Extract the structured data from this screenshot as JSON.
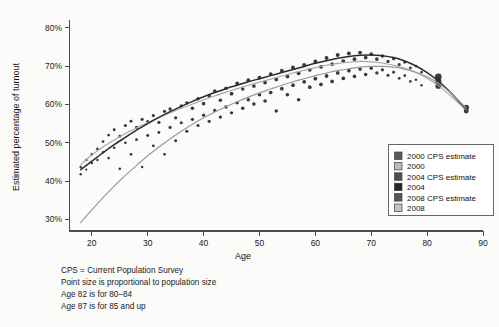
{
  "chart_data": {
    "type": "scatter",
    "title": "",
    "xlabel": "Age",
    "ylabel": "Estimated percentage of turnout",
    "xlim": [
      16,
      90
    ],
    "ylim": [
      0.27,
      0.82
    ],
    "xticks": [
      20,
      30,
      40,
      50,
      60,
      70,
      80,
      90
    ],
    "xtick_labels": [
      "20",
      "30",
      "40",
      "50",
      "60",
      "70",
      "80",
      "90"
    ],
    "yticks": [
      0.3,
      0.4,
      0.5,
      0.6,
      0.7,
      0.8
    ],
    "ytick_labels": [
      "30%",
      "40%",
      "50%",
      "60%",
      "70%",
      "80%"
    ],
    "grid": false,
    "legend_position": "right-lower",
    "note": "Point size is proportional to population size; ages 82 and 87 are aggregated bins.",
    "series": [
      {
        "name": "2000 CPS estimate",
        "color": "#555555",
        "marker": "square",
        "role": "legend-only-swatch"
      },
      {
        "name": "2000",
        "color": "#a8a8a8",
        "marker": "square",
        "role": "fitted-curve",
        "x": [
          18,
          20,
          22,
          24,
          26,
          28,
          30,
          32,
          34,
          36,
          38,
          40,
          42,
          44,
          46,
          48,
          50,
          52,
          54,
          56,
          58,
          60,
          62,
          64,
          66,
          68,
          70,
          72,
          74,
          76,
          78,
          80,
          82,
          84,
          86,
          87
        ],
        "y": [
          0.443,
          0.468,
          0.489,
          0.507,
          0.524,
          0.539,
          0.553,
          0.566,
          0.578,
          0.59,
          0.601,
          0.612,
          0.622,
          0.632,
          0.641,
          0.65,
          0.658,
          0.666,
          0.674,
          0.682,
          0.689,
          0.696,
          0.702,
          0.707,
          0.71,
          0.712,
          0.711,
          0.708,
          0.702,
          0.694,
          0.683,
          0.668,
          0.649,
          0.625,
          0.598,
          0.585
        ]
      },
      {
        "name": "2004 CPS estimate",
        "color": "#4a4a4a",
        "marker": "square",
        "role": "legend-only-swatch"
      },
      {
        "name": "2004",
        "color": "#2b2b2b",
        "marker": "square",
        "role": "fitted-curve",
        "x": [
          18,
          20,
          22,
          24,
          26,
          28,
          30,
          32,
          34,
          36,
          38,
          40,
          42,
          44,
          46,
          48,
          50,
          52,
          54,
          56,
          58,
          60,
          62,
          64,
          66,
          68,
          70,
          72,
          74,
          76,
          78,
          80,
          82,
          84,
          86,
          87
        ],
        "y": [
          0.43,
          0.452,
          0.474,
          0.495,
          0.514,
          0.533,
          0.55,
          0.566,
          0.581,
          0.595,
          0.608,
          0.62,
          0.631,
          0.641,
          0.65,
          0.659,
          0.667,
          0.675,
          0.683,
          0.691,
          0.699,
          0.707,
          0.714,
          0.72,
          0.725,
          0.728,
          0.729,
          0.727,
          0.722,
          0.713,
          0.7,
          0.683,
          0.661,
          0.634,
          0.603,
          0.588
        ]
      },
      {
        "name": "2008 CPS estimate",
        "color": "#555555",
        "marker": "square",
        "role": "legend-only-swatch"
      },
      {
        "name": "2008",
        "color": "#9a9a9a",
        "marker": "square",
        "role": "fitted-curve",
        "x": [
          18,
          20,
          22,
          24,
          26,
          28,
          30,
          32,
          34,
          36,
          38,
          40,
          42,
          44,
          46,
          48,
          50,
          52,
          54,
          56,
          58,
          60,
          62,
          64,
          66,
          68,
          70,
          72,
          74,
          76,
          78,
          80,
          82,
          84,
          86,
          87
        ],
        "y": [
          0.292,
          0.325,
          0.357,
          0.387,
          0.415,
          0.441,
          0.466,
          0.489,
          0.51,
          0.53,
          0.548,
          0.565,
          0.58,
          0.594,
          0.607,
          0.619,
          0.63,
          0.64,
          0.65,
          0.659,
          0.667,
          0.675,
          0.682,
          0.688,
          0.693,
          0.697,
          0.699,
          0.699,
          0.697,
          0.692,
          0.684,
          0.672,
          0.655,
          0.633,
          0.605,
          0.59
        ]
      }
    ],
    "points": [
      {
        "x": 18,
        "y": 0.437,
        "s": 2.0
      },
      {
        "x": 18,
        "y": 0.418,
        "s": 1.9
      },
      {
        "x": 19,
        "y": 0.455,
        "s": 2.0
      },
      {
        "x": 19,
        "y": 0.43,
        "s": 1.8
      },
      {
        "x": 20,
        "y": 0.47,
        "s": 2.2
      },
      {
        "x": 20,
        "y": 0.447,
        "s": 2.0
      },
      {
        "x": 21,
        "y": 0.484,
        "s": 2.1
      },
      {
        "x": 21,
        "y": 0.455,
        "s": 1.9
      },
      {
        "x": 22,
        "y": 0.503,
        "s": 2.2
      },
      {
        "x": 22,
        "y": 0.475,
        "s": 2.0
      },
      {
        "x": 23,
        "y": 0.52,
        "s": 2.3
      },
      {
        "x": 23,
        "y": 0.46,
        "s": 2.1
      },
      {
        "x": 24,
        "y": 0.534,
        "s": 2.4
      },
      {
        "x": 24,
        "y": 0.487,
        "s": 2.2
      },
      {
        "x": 25,
        "y": 0.517,
        "s": 2.3
      },
      {
        "x": 25,
        "y": 0.432,
        "s": 2.1
      },
      {
        "x": 26,
        "y": 0.545,
        "s": 2.5
      },
      {
        "x": 26,
        "y": 0.5,
        "s": 2.2
      },
      {
        "x": 27,
        "y": 0.556,
        "s": 2.4
      },
      {
        "x": 27,
        "y": 0.47,
        "s": 2.2
      },
      {
        "x": 28,
        "y": 0.54,
        "s": 2.5
      },
      {
        "x": 28,
        "y": 0.508,
        "s": 2.3
      },
      {
        "x": 29,
        "y": 0.561,
        "s": 2.5
      },
      {
        "x": 29,
        "y": 0.437,
        "s": 2.0
      },
      {
        "x": 30,
        "y": 0.555,
        "s": 2.6
      },
      {
        "x": 30,
        "y": 0.519,
        "s": 2.4
      },
      {
        "x": 31,
        "y": 0.571,
        "s": 2.5
      },
      {
        "x": 31,
        "y": 0.492,
        "s": 2.3
      },
      {
        "x": 32,
        "y": 0.553,
        "s": 2.6
      },
      {
        "x": 32,
        "y": 0.527,
        "s": 2.4
      },
      {
        "x": 33,
        "y": 0.582,
        "s": 2.6
      },
      {
        "x": 33,
        "y": 0.47,
        "s": 2.2
      },
      {
        "x": 34,
        "y": 0.588,
        "s": 2.7
      },
      {
        "x": 34,
        "y": 0.54,
        "s": 2.5
      },
      {
        "x": 35,
        "y": 0.565,
        "s": 2.6
      },
      {
        "x": 35,
        "y": 0.505,
        "s": 2.4
      },
      {
        "x": 36,
        "y": 0.596,
        "s": 2.7
      },
      {
        "x": 36,
        "y": 0.552,
        "s": 2.5
      },
      {
        "x": 37,
        "y": 0.604,
        "s": 2.7
      },
      {
        "x": 37,
        "y": 0.53,
        "s": 2.5
      },
      {
        "x": 38,
        "y": 0.59,
        "s": 2.8
      },
      {
        "x": 38,
        "y": 0.561,
        "s": 2.6
      },
      {
        "x": 39,
        "y": 0.615,
        "s": 2.8
      },
      {
        "x": 39,
        "y": 0.545,
        "s": 2.6
      },
      {
        "x": 40,
        "y": 0.602,
        "s": 2.9
      },
      {
        "x": 40,
        "y": 0.572,
        "s": 2.7
      },
      {
        "x": 41,
        "y": 0.622,
        "s": 2.8
      },
      {
        "x": 41,
        "y": 0.556,
        "s": 2.6
      },
      {
        "x": 42,
        "y": 0.635,
        "s": 2.9
      },
      {
        "x": 42,
        "y": 0.584,
        "s": 2.7
      },
      {
        "x": 43,
        "y": 0.611,
        "s": 2.8
      },
      {
        "x": 43,
        "y": 0.567,
        "s": 2.7
      },
      {
        "x": 44,
        "y": 0.642,
        "s": 2.9
      },
      {
        "x": 44,
        "y": 0.593,
        "s": 2.8
      },
      {
        "x": 45,
        "y": 0.628,
        "s": 3.0
      },
      {
        "x": 45,
        "y": 0.578,
        "s": 2.7
      },
      {
        "x": 46,
        "y": 0.655,
        "s": 3.0
      },
      {
        "x": 46,
        "y": 0.604,
        "s": 2.8
      },
      {
        "x": 47,
        "y": 0.64,
        "s": 2.9
      },
      {
        "x": 47,
        "y": 0.59,
        "s": 2.8
      },
      {
        "x": 48,
        "y": 0.663,
        "s": 3.0
      },
      {
        "x": 48,
        "y": 0.612,
        "s": 2.9
      },
      {
        "x": 49,
        "y": 0.648,
        "s": 3.0
      },
      {
        "x": 49,
        "y": 0.601,
        "s": 2.8
      },
      {
        "x": 50,
        "y": 0.67,
        "s": 3.1
      },
      {
        "x": 50,
        "y": 0.625,
        "s": 2.9
      },
      {
        "x": 51,
        "y": 0.657,
        "s": 3.0
      },
      {
        "x": 51,
        "y": 0.609,
        "s": 2.9
      },
      {
        "x": 52,
        "y": 0.679,
        "s": 3.1
      },
      {
        "x": 52,
        "y": 0.631,
        "s": 3.0
      },
      {
        "x": 53,
        "y": 0.665,
        "s": 3.0
      },
      {
        "x": 53,
        "y": 0.583,
        "s": 2.8
      },
      {
        "x": 54,
        "y": 0.688,
        "s": 3.1
      },
      {
        "x": 54,
        "y": 0.641,
        "s": 3.0
      },
      {
        "x": 55,
        "y": 0.673,
        "s": 3.1
      },
      {
        "x": 55,
        "y": 0.625,
        "s": 2.9
      },
      {
        "x": 56,
        "y": 0.696,
        "s": 3.2
      },
      {
        "x": 56,
        "y": 0.65,
        "s": 3.0
      },
      {
        "x": 57,
        "y": 0.681,
        "s": 3.1
      },
      {
        "x": 57,
        "y": 0.612,
        "s": 2.9
      },
      {
        "x": 58,
        "y": 0.703,
        "s": 3.2
      },
      {
        "x": 58,
        "y": 0.659,
        "s": 3.0
      },
      {
        "x": 59,
        "y": 0.69,
        "s": 3.1
      },
      {
        "x": 59,
        "y": 0.645,
        "s": 3.0
      },
      {
        "x": 60,
        "y": 0.712,
        "s": 3.2
      },
      {
        "x": 60,
        "y": 0.667,
        "s": 3.1
      },
      {
        "x": 61,
        "y": 0.698,
        "s": 3.1
      },
      {
        "x": 61,
        "y": 0.652,
        "s": 3.0
      },
      {
        "x": 62,
        "y": 0.721,
        "s": 3.2
      },
      {
        "x": 62,
        "y": 0.674,
        "s": 3.1
      },
      {
        "x": 63,
        "y": 0.705,
        "s": 3.1
      },
      {
        "x": 63,
        "y": 0.66,
        "s": 3.0
      },
      {
        "x": 64,
        "y": 0.729,
        "s": 3.2
      },
      {
        "x": 64,
        "y": 0.682,
        "s": 3.0
      },
      {
        "x": 65,
        "y": 0.713,
        "s": 3.1
      },
      {
        "x": 65,
        "y": 0.668,
        "s": 3.0
      },
      {
        "x": 66,
        "y": 0.733,
        "s": 3.2
      },
      {
        "x": 66,
        "y": 0.688,
        "s": 3.0
      },
      {
        "x": 67,
        "y": 0.718,
        "s": 3.1
      },
      {
        "x": 67,
        "y": 0.673,
        "s": 2.9
      },
      {
        "x": 68,
        "y": 0.735,
        "s": 3.1
      },
      {
        "x": 68,
        "y": 0.692,
        "s": 2.9
      },
      {
        "x": 69,
        "y": 0.722,
        "s": 3.0
      },
      {
        "x": 69,
        "y": 0.678,
        "s": 2.9
      },
      {
        "x": 70,
        "y": 0.731,
        "s": 3.0
      },
      {
        "x": 70,
        "y": 0.694,
        "s": 2.8
      },
      {
        "x": 71,
        "y": 0.718,
        "s": 2.9
      },
      {
        "x": 71,
        "y": 0.682,
        "s": 2.7
      },
      {
        "x": 72,
        "y": 0.726,
        "s": 2.8
      },
      {
        "x": 72,
        "y": 0.69,
        "s": 2.6
      },
      {
        "x": 73,
        "y": 0.712,
        "s": 2.7
      },
      {
        "x": 73,
        "y": 0.676,
        "s": 2.5
      },
      {
        "x": 74,
        "y": 0.719,
        "s": 2.6
      },
      {
        "x": 74,
        "y": 0.684,
        "s": 2.4
      },
      {
        "x": 75,
        "y": 0.704,
        "s": 2.5
      },
      {
        "x": 75,
        "y": 0.668,
        "s": 2.3
      },
      {
        "x": 76,
        "y": 0.71,
        "s": 2.4
      },
      {
        "x": 76,
        "y": 0.675,
        "s": 2.2
      },
      {
        "x": 77,
        "y": 0.695,
        "s": 2.3
      },
      {
        "x": 77,
        "y": 0.66,
        "s": 2.1
      },
      {
        "x": 78,
        "y": 0.7,
        "s": 2.2
      },
      {
        "x": 78,
        "y": 0.664,
        "s": 2.0
      },
      {
        "x": 79,
        "y": 0.684,
        "s": 2.1
      },
      {
        "x": 79,
        "y": 0.65,
        "s": 1.9
      },
      {
        "x": 82,
        "y": 0.672,
        "s": 5.4
      },
      {
        "x": 82,
        "y": 0.66,
        "s": 5.0
      },
      {
        "x": 82,
        "y": 0.648,
        "s": 4.6
      },
      {
        "x": 87,
        "y": 0.592,
        "s": 4.4
      },
      {
        "x": 87,
        "y": 0.583,
        "s": 4.0
      }
    ]
  },
  "legend": {
    "items": [
      {
        "label": "2000 CPS estimate",
        "color": "#5a5a5a"
      },
      {
        "label": "2000",
        "color": "#bcbcbc"
      },
      {
        "label": "2004 CPS estimate",
        "color": "#4f4f4f"
      },
      {
        "label": "2004",
        "color": "#262626"
      },
      {
        "label": "2008 CPS estimate",
        "color": "#585858"
      },
      {
        "label": "2008",
        "color": "#c4c4c4"
      }
    ]
  },
  "notes": [
    "CPS = Current Population Survey",
    "Point size is proportional to population size",
    "Age 82 is for 80–84",
    "Age 87 is for 85 and up"
  ]
}
